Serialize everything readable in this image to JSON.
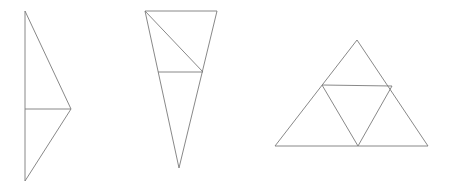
{
  "figures": [
    {
      "name": "left-kite-triangle",
      "outline": [
        [
          25,
          11
        ],
        [
          71,
          109
        ],
        [
          25,
          181
        ]
      ],
      "lines": [
        [
          [
            25,
            109
          ],
          [
            71,
            109
          ]
        ]
      ]
    },
    {
      "name": "middle-inverted-triangle",
      "outline": [
        [
          145,
          11
        ],
        [
          217,
          11
        ],
        [
          179,
          168
        ]
      ],
      "lines": [
        [
          [
            158,
            72
          ],
          [
            203,
            72
          ]
        ],
        [
          [
            145,
            11
          ],
          [
            203,
            72
          ]
        ]
      ]
    },
    {
      "name": "right-subdivided-triangle",
      "outline": [
        [
          357,
          40
        ],
        [
          275,
          146
        ],
        [
          428,
          146
        ]
      ],
      "lines": [
        [
          [
            322,
            85
          ],
          [
            392,
            86
          ]
        ],
        [
          [
            322,
            85
          ],
          [
            358,
            146
          ]
        ],
        [
          [
            392,
            86
          ],
          [
            358,
            146
          ]
        ]
      ]
    }
  ],
  "stroke_color": "#7a7a7a"
}
